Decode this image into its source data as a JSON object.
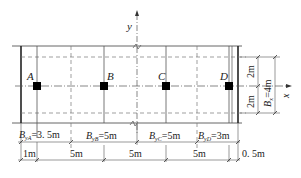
{
  "axes": {
    "x_label": "x",
    "y_label": "y"
  },
  "points": [
    {
      "id": "A",
      "label": "A",
      "x": 37
    },
    {
      "id": "B",
      "label": "B",
      "x": 104
    },
    {
      "id": "C",
      "label": "C",
      "x": 166
    },
    {
      "id": "D",
      "label": "D",
      "x": 229
    }
  ],
  "influence_widths": [
    {
      "name": "B",
      "sub": "yA",
      "value": "=3. 5m"
    },
    {
      "name": "B",
      "sub": "yB",
      "value": "=5m"
    },
    {
      "name": "B",
      "sub": "yC",
      "value": "=5m"
    },
    {
      "name": "B",
      "sub": "yD",
      "value": "=3m"
    }
  ],
  "spacings": [
    "1m",
    "5m",
    "5m",
    "5m",
    "0. 5m"
  ],
  "right_dims": {
    "upper": "2m",
    "lower": "2m",
    "total_name": "B",
    "total_sub": "x",
    "total_value": "=4m"
  }
}
